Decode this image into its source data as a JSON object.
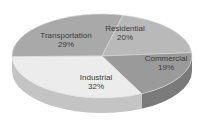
{
  "chart_data": {
    "type": "pie",
    "style": "3d",
    "title": "",
    "categories": [
      "Industrial",
      "Transportation",
      "Residential",
      "Commercial"
    ],
    "values": [
      32,
      29,
      20,
      19
    ],
    "labels": [
      {
        "name": "Industrial",
        "pct": "32%"
      },
      {
        "name": "Transportation",
        "pct": "29%"
      },
      {
        "name": "Residential",
        "pct": "20%"
      },
      {
        "name": "Commercial",
        "pct": "19%"
      }
    ],
    "colors": {
      "Industrial": "#ececec",
      "Transportation": "#a9a9a9",
      "Residential": "#b9b9b9",
      "Commercial": "#9a9a9a"
    },
    "legend": "none",
    "data_labels": "inside"
  }
}
